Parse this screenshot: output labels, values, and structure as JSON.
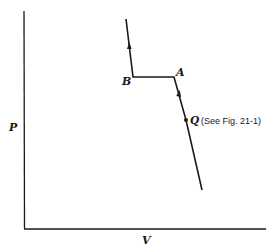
{
  "diagram": {
    "type": "pv-diagram",
    "axes": {
      "y_label": "P",
      "x_label": "V"
    },
    "points": {
      "A": {
        "label": "A"
      },
      "B": {
        "label": "B"
      },
      "Q": {
        "label": "Q",
        "annotation": "(See Fig. 21-1)"
      }
    },
    "curve": {
      "description": "Isotherm with two-phase horizontal segment B–A; arrows indicate direction of compression (upward)",
      "segments": [
        {
          "from": "bottom",
          "to": "Q"
        },
        {
          "from": "Q",
          "to": "A"
        },
        {
          "from": "A",
          "to": "B"
        },
        {
          "from": "B",
          "to": "top"
        }
      ]
    },
    "colors": {
      "line": "#1a1a1a",
      "background": "#ffffff"
    }
  }
}
